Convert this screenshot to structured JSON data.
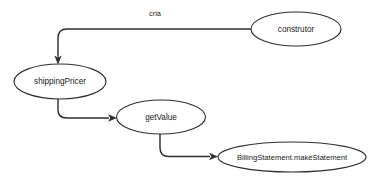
{
  "diagram": {
    "type": "call-graph",
    "title": "",
    "background_color": "#ffffff",
    "stroke_color": "#2f2f2f",
    "text_color": "#1a1a1a",
    "node_fill": "#ffffff",
    "width": 375,
    "height": 185,
    "nodes": [
      {
        "id": "construtor",
        "label": "construtor",
        "shape": "ellipse",
        "cx": 296,
        "cy": 29,
        "rx": 45,
        "ry": 17
      },
      {
        "id": "shippingPricer",
        "label": "shippingPricer",
        "shape": "ellipse",
        "cx": 60,
        "cy": 81.5,
        "rx": 46,
        "ry": 17.5
      },
      {
        "id": "getValue",
        "label": "getValue",
        "shape": "ellipse",
        "cx": 161,
        "cy": 117,
        "rx": 44.5,
        "ry": 17
      },
      {
        "id": "makeStatement",
        "label": "BillingStatement.makeStatement",
        "shape": "ellipse",
        "cx": 292,
        "cy": 157,
        "rx": 74,
        "ry": 15
      }
    ],
    "edges": [
      {
        "id": "edge-construtor-shippingPricer",
        "from": "construtor",
        "to": "shippingPricer",
        "label": "cria",
        "label_x": 155,
        "label_y": 14,
        "arrow_direction": "down"
      },
      {
        "id": "edge-shippingPricer-getValue",
        "from": "shippingPricer",
        "to": "getValue",
        "label": "",
        "arrow_direction": "right"
      },
      {
        "id": "edge-getValue-makeStatement",
        "from": "getValue",
        "to": "makeStatement",
        "label": "",
        "arrow_direction": "right"
      }
    ]
  }
}
